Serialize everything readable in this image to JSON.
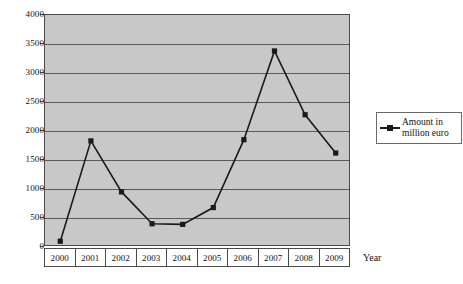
{
  "chart_data": {
    "type": "line",
    "title": "",
    "xlabel": "Year",
    "ylabel": "",
    "categories": [
      "2000",
      "2001",
      "2002",
      "2003",
      "2004",
      "2005",
      "2006",
      "2007",
      "2008",
      "2009"
    ],
    "series": [
      {
        "name": "Amount in million euro",
        "values": [
          100,
          1830,
          950,
          400,
          390,
          680,
          1850,
          3380,
          2280,
          1620
        ]
      }
    ],
    "ylim": [
      0,
      4000
    ],
    "yticks": [
      0,
      500,
      1000,
      1500,
      2000,
      2500,
      3000,
      3500,
      4000
    ],
    "ytick_labels": [
      "0",
      "500",
      "1000",
      "1500",
      "2000",
      "2500",
      "3000",
      "3500",
      "4000"
    ],
    "grid": "horizontal",
    "legend_position": "right",
    "marker": "square",
    "plot_background_color": "#c8c8c8",
    "line_color": "#1a1a1a",
    "marker_color": "#1a1a1a"
  },
  "legend": {
    "entries": [
      {
        "label_line1": "Amount in",
        "label_line2": "million euro"
      }
    ]
  },
  "axis": {
    "x_title": "Year"
  }
}
